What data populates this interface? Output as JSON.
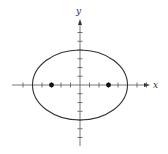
{
  "diagram": {
    "type": "ellipse-with-foci",
    "x_axis_label": "x",
    "y_axis_label": "y",
    "tick_spacing_units": 1,
    "x_ticks": [
      -6,
      -5,
      -4,
      -3,
      -2,
      -1,
      1,
      2,
      3,
      4,
      5,
      6,
      7
    ],
    "y_ticks": [
      -6,
      -5,
      -4,
      -3,
      -2,
      -1,
      1,
      2,
      3,
      4,
      5,
      6
    ],
    "ellipse": {
      "center": [
        0,
        0
      ],
      "semi_major_x": 5,
      "semi_minor_y": 4
    },
    "foci": [
      [
        -3,
        0
      ],
      [
        3,
        0
      ]
    ],
    "colors": {
      "stroke": "#333333",
      "background": "#ffffff"
    }
  }
}
